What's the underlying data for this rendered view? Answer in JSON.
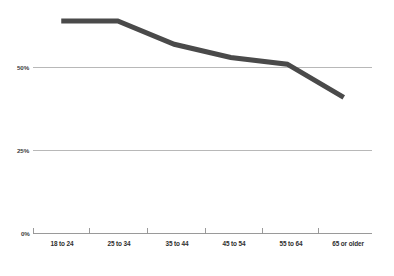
{
  "chart_data": {
    "type": "line",
    "title": "",
    "subtitle": "",
    "xlabel": "",
    "ylabel": "",
    "categories": [
      "18 to 24",
      "25 to 34",
      "35 to 44",
      "45 to 54",
      "55 to 64",
      "65 or older"
    ],
    "values": [
      64,
      64,
      57,
      53,
      51,
      41
    ],
    "series": [
      {
        "name": "",
        "values": [
          64,
          64,
          57,
          53,
          51,
          41
        ]
      }
    ],
    "ylim": [
      0,
      75
    ],
    "ytick_values": [
      0,
      25,
      50
    ],
    "ytick_labels": [
      "0%",
      "25%",
      "50%"
    ],
    "grid": true,
    "gridlines_at": [
      25,
      50
    ],
    "legend": "none",
    "legend_position": "none",
    "annotations": [],
    "line_color": "#4a4a4a",
    "grid_color": "#9a9a9a",
    "axis_color": "#8f8f8f",
    "background_color": "#ffffff",
    "line_width": 5
  },
  "axis": {
    "y_labels": [
      "50%",
      "25%",
      "0%"
    ],
    "x_labels": [
      "18 to 24",
      "25 to 34",
      "35 to 44",
      "45 to 54",
      "55 to 64",
      "65 or older"
    ]
  }
}
